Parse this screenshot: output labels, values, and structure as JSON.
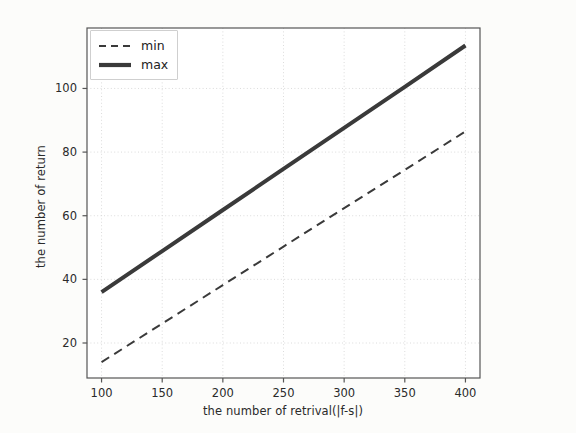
{
  "chart_data": {
    "type": "line",
    "title": "",
    "xlabel": "the number of retrival(|f-s|)",
    "ylabel": "the number of return",
    "x": [
      100,
      150,
      200,
      250,
      300,
      350,
      400
    ],
    "series": [
      {
        "name": "min",
        "style": "dashed",
        "color": "#3a3a3a",
        "linewidth": 2.0,
        "values": [
          14,
          26.1,
          38.2,
          50.3,
          62.4,
          74.4,
          86.5
        ]
      },
      {
        "name": "max",
        "style": "solid",
        "color": "#3a3a3a",
        "linewidth": 4.0,
        "values": [
          36,
          48.9,
          61.8,
          74.7,
          87.6,
          100.5,
          113.5
        ]
      }
    ],
    "xticks": [
      100,
      150,
      200,
      250,
      300,
      350,
      400
    ],
    "yticks": [
      20,
      40,
      60,
      80,
      100
    ],
    "xlim": [
      88,
      412
    ],
    "ylim": [
      9,
      119
    ],
    "grid": true,
    "grid_style": "dotted",
    "grid_color": "#d8d8d8",
    "legend_position": "upper left",
    "legend_entries": [
      "min",
      "max"
    ],
    "background": "#ffffff",
    "figure_background": "#fcfcfa",
    "axes_color": "#555555"
  }
}
